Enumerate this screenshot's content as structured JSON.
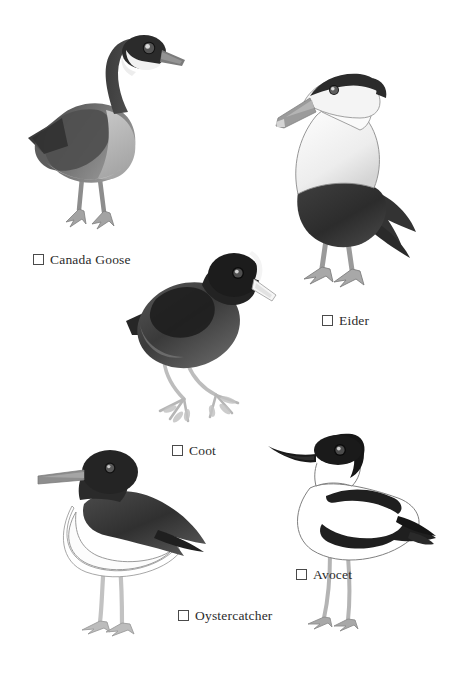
{
  "page": {
    "width": 453,
    "height": 673,
    "background": "#ffffff",
    "kind": "bird-identification-checklist",
    "style": "grayscale watercolour illustrations with tick-box labels"
  },
  "palette": {
    "ink": "#2b2b2b",
    "checkbox_border": "#4a4a4a",
    "outline": "#5a5a5a",
    "dark": "#2e2e2e",
    "near_black": "#1a1a1a",
    "mid_grey": "#6f6f6f",
    "body_grey": "#7d7d7d",
    "light_grey": "#bdbdbd",
    "pale": "#d8d8d8",
    "white": "#ffffff",
    "leg_grey": "#a9a9a9",
    "bill_grey": "#8c8c8c"
  },
  "birds": [
    {
      "id": "canada-goose",
      "name": "Canada Goose",
      "checked": false,
      "position": {
        "x": 22,
        "y": 28,
        "width": 160,
        "height": 215
      },
      "label_position": {
        "x": 33,
        "y": 253
      },
      "features": {
        "head": "black head and neck",
        "marking": "white cheek chinstrap patch",
        "body": "grey-brown body with pale breast",
        "bill": "dark grey bill",
        "legs": "pale grey legs, webbed feet",
        "pose": "standing, head turned right, long S-curved neck"
      }
    },
    {
      "id": "eider",
      "name": "Eider",
      "checked": false,
      "position": {
        "x": 276,
        "y": 72,
        "width": 152,
        "height": 230
      },
      "label_position": {
        "x": 322,
        "y": 314
      },
      "features": {
        "head": "white face with black crown cap",
        "body": "white breast and neck, dark belly and flanks",
        "bill": "long wedge-shaped grey bill sloping to forehead",
        "tail": "dark pointed tail with wing plumes",
        "legs": "grey webbed legs",
        "pose": "standing upright, head turned left"
      }
    },
    {
      "id": "coot",
      "name": "Coot",
      "checked": false,
      "position": {
        "x": 126,
        "y": 243,
        "width": 148,
        "height": 185
      },
      "label_position": {
        "x": 172,
        "y": 444
      },
      "features": {
        "head": "all-black head",
        "marking": "white frontal shield on forehead",
        "body": "sooty black rounded body",
        "bill": "short white conical bill",
        "legs": "pale grey legs with long lobed toes",
        "pose": "crouched forward, head turned right"
      }
    },
    {
      "id": "oystercatcher",
      "name": "Oystercatcher",
      "checked": false,
      "position": {
        "x": 38,
        "y": 446,
        "width": 175,
        "height": 185
      },
      "label_position": {
        "x": 178,
        "y": 609
      },
      "features": {
        "head": "black head and neck",
        "body": "black back and wings, white underparts",
        "bill": "long straight blunt bill pointing left",
        "legs": "long pale pinkish-grey legs",
        "pose": "standing, facing left"
      }
    },
    {
      "id": "avocet",
      "name": "Avocet",
      "checked": false,
      "position": {
        "x": 268,
        "y": 432,
        "width": 175,
        "height": 200
      },
      "label_position": {
        "x": 296,
        "y": 568
      },
      "features": {
        "head": "black cap over crown and nape",
        "body": "white body with bold black wing bands",
        "bill": "long thin black upcurved bill",
        "legs": "long slender blue-grey legs",
        "pose": "standing, head turned left"
      }
    }
  ]
}
